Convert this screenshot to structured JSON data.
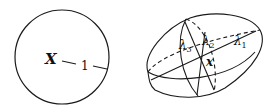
{
  "left_figure": {
    "shape": "circle",
    "center_label": "X",
    "radius_label": "1"
  },
  "right_figure": {
    "shape": "ellipsoid",
    "center_label": "x",
    "axis_labels": {
      "lambda1": "λ",
      "lambda1_sub": "1",
      "lambda2": "λ",
      "lambda2_sub": "2",
      "lambda3": "λ",
      "lambda3_sub": "3"
    }
  },
  "colors": {
    "stroke": "#1a1a1a",
    "background": "#ffffff"
  }
}
